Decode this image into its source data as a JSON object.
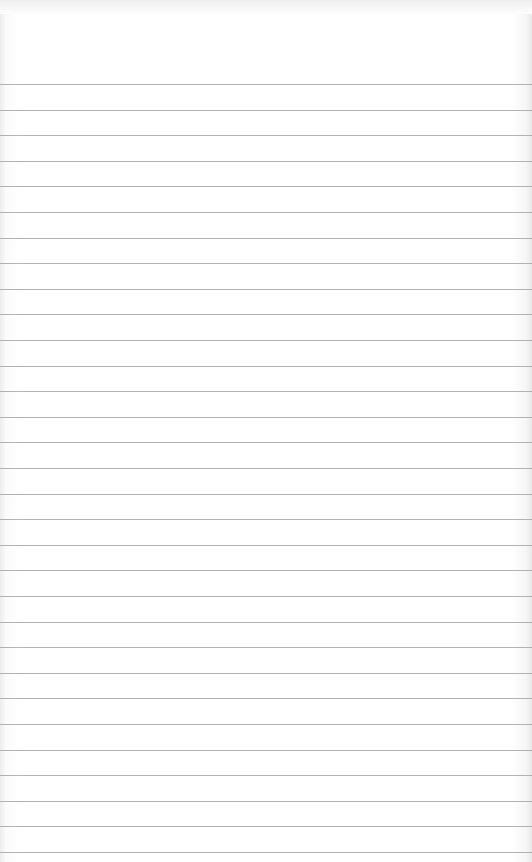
{
  "page": {
    "type": "ruled-notepaper",
    "background_color": "#ffffff",
    "line_color": "#9a9a9a",
    "first_line_y": 84,
    "line_spacing": 25.6,
    "line_count": 31,
    "text": ""
  }
}
